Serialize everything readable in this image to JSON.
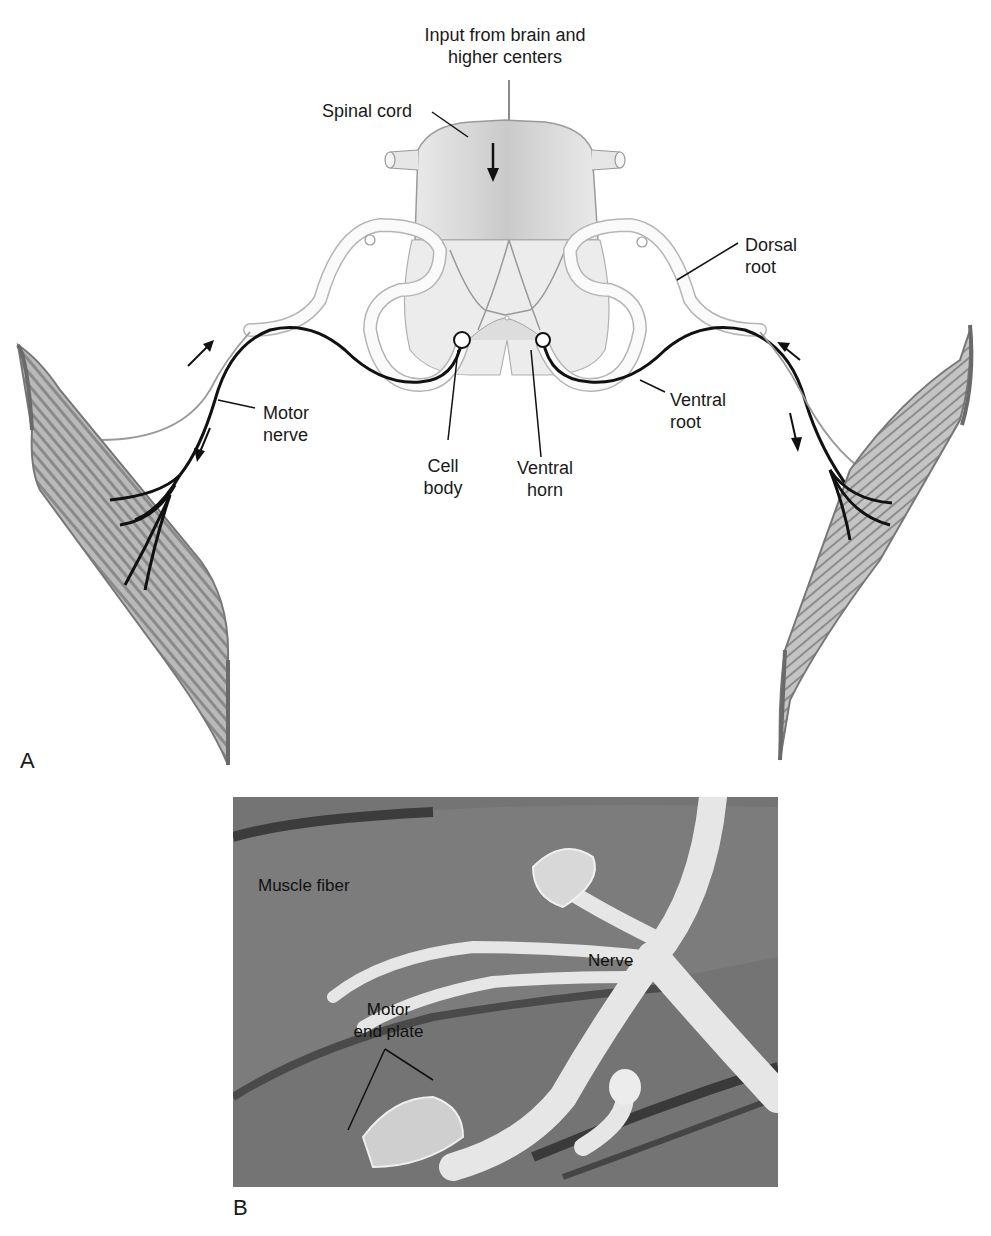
{
  "figure": {
    "panels": [
      {
        "letter": "A",
        "labels": {
          "input": "Input from brain and\nhigher centers",
          "spinal_cord": "Spinal cord",
          "dorsal_root": "Dorsal\nroot",
          "ventral_root": "Ventral\nroot",
          "motor_nerve": "Motor\nnerve",
          "cell_body": "Cell\nbody",
          "ventral_horn": "Ventral\nhorn"
        }
      },
      {
        "letter": "B",
        "labels": {
          "muscle_fiber": "Muscle fiber",
          "nerve": "Nerve",
          "motor_end_plate": "Motor\nend plate"
        }
      }
    ],
    "colors": {
      "cord_fill": "#e4e4e4",
      "cord_shadow": "#c8c8c8",
      "nerve_black": "#111111",
      "outline_gray": "#9a9a9a",
      "muscle_fill": "#bdbdbd",
      "muscle_stripe": "#7a7a7a",
      "photo_bg": "#6e6e6e",
      "photo_nerve": "#e8e8e8"
    }
  }
}
